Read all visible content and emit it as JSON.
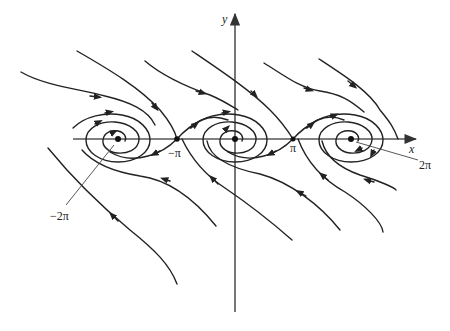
{
  "figure": {
    "type": "phase-portrait",
    "axes": {
      "x_label": "x",
      "y_label": "y"
    },
    "tick_labels": {
      "neg_pi": "−π",
      "pi": "π",
      "two_pi": "2π",
      "neg_two_pi": "−2π"
    },
    "equilibria": [
      {
        "x_label": "−2π",
        "kind": "stable spiral"
      },
      {
        "x_label": "−π",
        "kind": "saddle"
      },
      {
        "x_label": "0",
        "kind": "stable spiral"
      },
      {
        "x_label": "π",
        "kind": "saddle"
      },
      {
        "x_label": "2π",
        "kind": "stable spiral"
      }
    ],
    "colors": {
      "curve": "#222222",
      "axis": "#555555",
      "background": "#ffffff"
    }
  }
}
